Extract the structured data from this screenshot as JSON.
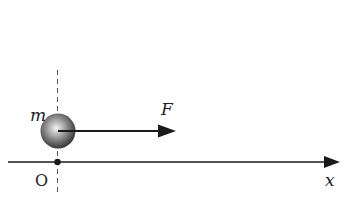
{
  "diagram": {
    "labels": {
      "mass": "m",
      "force": "F",
      "origin": "O",
      "axis": "x"
    },
    "colors": {
      "line": "#1a1a1a",
      "dash": "#555555",
      "ball_light": "#f2f2f2",
      "ball_dark": "#3a3a3a"
    }
  }
}
